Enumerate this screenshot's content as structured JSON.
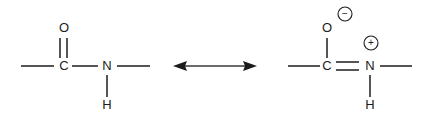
{
  "diagram": {
    "background_color": "#ffffff",
    "bond_color": "#1c1c1c",
    "arrow_color": "#3a3a3a"
  },
  "left_structure": {
    "name": "neutral-amide-form",
    "atoms": {
      "oxygen": "O",
      "carbon": "C",
      "nitrogen": "N",
      "hydrogen": "H"
    },
    "bonds": [
      {
        "name": "methyl-to-carbon",
        "order": 1,
        "orientation": "horizontal"
      },
      {
        "name": "carbon-to-oxygen",
        "order": 2,
        "orientation": "vertical"
      },
      {
        "name": "carbon-to-nitrogen",
        "order": 1,
        "orientation": "horizontal"
      },
      {
        "name": "nitrogen-to-hydrogen",
        "order": 1,
        "orientation": "vertical"
      },
      {
        "name": "nitrogen-to-methyl",
        "order": 1,
        "orientation": "horizontal"
      }
    ],
    "charges": []
  },
  "resonance_arrow": {
    "name": "resonance-double-arrow",
    "type": "double-headed",
    "label": ""
  },
  "right_structure": {
    "name": "charge-separated-amide-form",
    "atoms": {
      "oxygen": "O",
      "carbon": "C",
      "nitrogen": "N",
      "hydrogen": "H"
    },
    "bonds": [
      {
        "name": "methyl-to-carbon",
        "order": 1,
        "orientation": "horizontal"
      },
      {
        "name": "carbon-to-oxygen",
        "order": 1,
        "orientation": "vertical"
      },
      {
        "name": "carbon-to-nitrogen",
        "order": 2,
        "orientation": "horizontal"
      },
      {
        "name": "nitrogen-to-hydrogen",
        "order": 1,
        "orientation": "vertical"
      },
      {
        "name": "nitrogen-to-methyl",
        "order": 1,
        "orientation": "horizontal"
      }
    ],
    "charges": [
      {
        "name": "oxygen-negative-charge",
        "sign": "−",
        "on_atom": "O"
      },
      {
        "name": "nitrogen-positive-charge",
        "sign": "+",
        "on_atom": "N"
      }
    ]
  }
}
